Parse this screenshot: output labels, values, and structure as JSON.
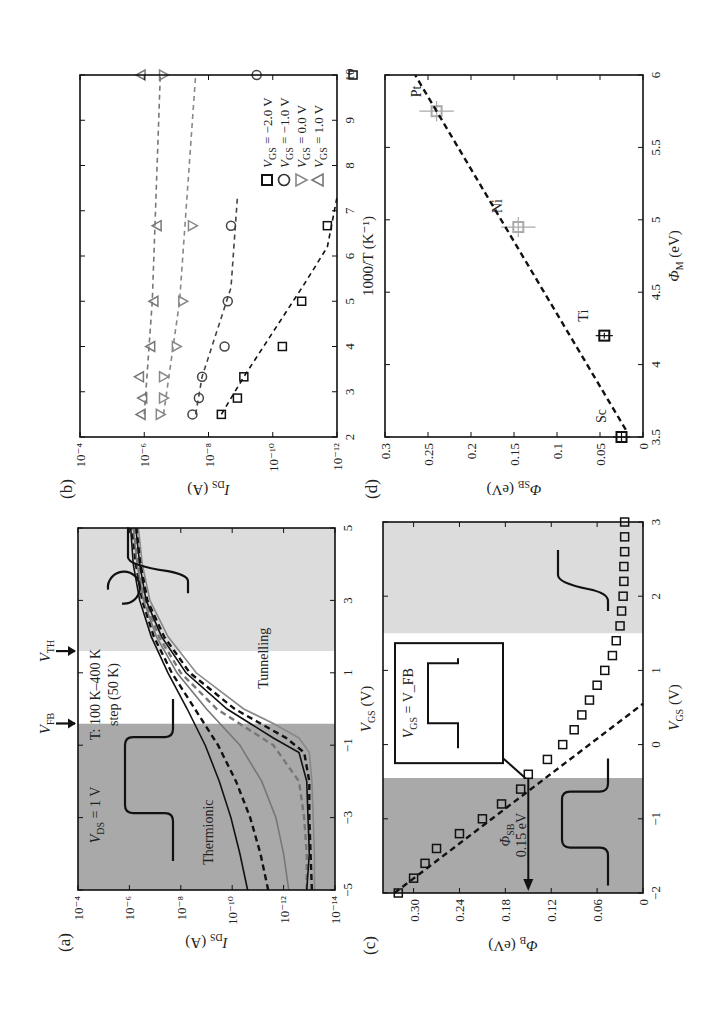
{
  "figure": {
    "panels": [
      "(a)",
      "(b)",
      "(c)",
      "(d)"
    ],
    "orientation": "rotated 90 degrees counter-clockwise on page"
  },
  "chart_data": [
    {
      "id": "a",
      "panel_label": "(a)",
      "type": "line",
      "title": "",
      "xlabel": "V_GS (V)",
      "ylabel": "I_DS (A)",
      "xlim": [
        -5,
        5
      ],
      "xticks": [
        -5,
        -3,
        -1,
        1,
        3,
        5
      ],
      "yscale": "log",
      "ylim_exp": [
        -14,
        -4
      ],
      "yticks_exp": [
        -14,
        -12,
        -10,
        -8,
        -6,
        -4
      ],
      "regions": [
        {
          "from": -5,
          "to": -0.4,
          "fill": "#a9a9a9",
          "name": "Thermionic"
        },
        {
          "from": -0.4,
          "to": 1.6,
          "fill": "#ffffff",
          "name": "flat-band to threshold"
        },
        {
          "from": 1.6,
          "to": 5,
          "fill": "#dcdcdc",
          "name": "Tunnelling"
        }
      ],
      "markers_top": [
        {
          "label": "V_FB",
          "x": -0.4
        },
        {
          "label": "V_TH",
          "x": 1.6
        }
      ],
      "annotations": [
        "V_DS = 1 V",
        "T: 100 K–400 K",
        "step (50 K)",
        "Thermionic",
        "Tunnelling"
      ],
      "series": [
        {
          "name": "400 K",
          "style": "solid",
          "color": "#111",
          "x": [
            -5,
            -4,
            -3,
            -2,
            -1,
            0,
            1,
            2,
            3,
            4,
            5
          ],
          "y_exp": [
            -10.6,
            -10.3,
            -9.95,
            -9.5,
            -8.95,
            -8.25,
            -7.5,
            -6.85,
            -6.4,
            -6.15,
            -6.05
          ]
        },
        {
          "name": "350 K",
          "style": "dashed",
          "color": "#111",
          "x": [
            -5,
            -4,
            -3,
            -2,
            -1,
            0,
            1,
            2,
            3,
            4,
            5
          ],
          "y_exp": [
            -11.4,
            -11.1,
            -10.7,
            -10.15,
            -9.45,
            -8.55,
            -7.65,
            -6.95,
            -6.5,
            -6.25,
            -6.1
          ]
        },
        {
          "name": "300 K",
          "style": "solid",
          "color": "#777",
          "x": [
            -5,
            -4,
            -3,
            -2,
            -1,
            0,
            1,
            2,
            3,
            4,
            5
          ],
          "y_exp": [
            -12.2,
            -12.0,
            -11.7,
            -11.15,
            -10.3,
            -9.0,
            -7.85,
            -7.05,
            -6.55,
            -6.3,
            -6.15
          ]
        },
        {
          "name": "250 K",
          "style": "dashed",
          "color": "#777",
          "x": [
            -5,
            -4,
            -3,
            -2,
            -1,
            -0.5,
            0,
            1,
            2,
            3,
            4,
            5
          ],
          "y_exp": [
            -12.9,
            -12.9,
            -12.8,
            -12.6,
            -11.6,
            -10.5,
            -9.4,
            -8.0,
            -7.15,
            -6.6,
            -6.35,
            -6.2
          ]
        },
        {
          "name": "200 K",
          "style": "solid",
          "color": "#111",
          "x": [
            -5,
            -4,
            -3,
            -2,
            -1.2,
            -0.8,
            -0.4,
            0,
            1,
            2,
            3,
            4,
            5
          ],
          "y_exp": [
            -12.9,
            -13.0,
            -12.95,
            -12.9,
            -12.6,
            -11.6,
            -10.7,
            -9.8,
            -8.2,
            -7.25,
            -6.65,
            -6.4,
            -6.25
          ]
        },
        {
          "name": "150 K",
          "style": "dashed",
          "color": "#111",
          "x": [
            -5,
            -4,
            -3,
            -2,
            -1.2,
            -0.8,
            -0.4,
            0,
            1,
            2,
            3,
            4,
            5
          ],
          "y_exp": [
            -13.1,
            -13.05,
            -13.0,
            -13.0,
            -12.8,
            -12.1,
            -11.1,
            -10.1,
            -8.35,
            -7.35,
            -6.7,
            -6.45,
            -6.3
          ]
        },
        {
          "name": "100 K",
          "style": "solid",
          "color": "#888",
          "x": [
            -5,
            -4,
            -3,
            -2,
            -1.2,
            -0.8,
            -0.4,
            0,
            1,
            2,
            3,
            4,
            5
          ],
          "y_exp": [
            -13.2,
            -13.2,
            -13.15,
            -13.1,
            -13.0,
            -12.6,
            -11.6,
            -10.45,
            -8.6,
            -7.5,
            -6.8,
            -6.5,
            -6.35
          ]
        }
      ]
    },
    {
      "id": "b",
      "panel_label": "(b)",
      "type": "scatter",
      "xlabel": "1000/T (K⁻¹)",
      "ylabel": "I_DS (A)",
      "xlim": [
        2,
        10
      ],
      "xticks": [
        2,
        3,
        4,
        5,
        6,
        7,
        8,
        9,
        10
      ],
      "yscale": "log",
      "ylim_exp": [
        -12,
        -4
      ],
      "yticks_exp": [
        -12,
        -10,
        -8,
        -6,
        -4
      ],
      "legend": [
        {
          "marker": "square",
          "label": "V_GS = −2.0 V"
        },
        {
          "marker": "circle",
          "label": "V_GS = −1.0 V"
        },
        {
          "marker": "triangle-down",
          "label": "V_GS = 0.0 V"
        },
        {
          "marker": "triangle-up",
          "label": "V_GS = 1.0 V"
        }
      ],
      "legend_position": "lower right",
      "series": [
        {
          "name": "V_GS = -2.0 V",
          "marker": "square",
          "color": "#111",
          "x": [
            2.5,
            2.86,
            3.33,
            4.0,
            5.0,
            6.67,
            10.0
          ],
          "y_exp": [
            -8.4,
            -8.9,
            -9.1,
            -10.3,
            -10.9,
            -11.7,
            -12.5
          ],
          "fit_x": [
            2.5,
            3.33,
            5.4,
            6.2,
            7.3
          ],
          "fit_y_exp": [
            -8.4,
            -9.1,
            -11.0,
            -11.7,
            -12.0
          ]
        },
        {
          "name": "V_GS = -1.0 V",
          "marker": "circle",
          "color": "#444",
          "x": [
            2.5,
            2.86,
            3.33,
            4.0,
            5.0,
            6.67,
            10.0
          ],
          "y_exp": [
            -7.5,
            -7.7,
            -7.8,
            -8.5,
            -8.6,
            -8.7,
            -9.5
          ],
          "fit_x": [
            2.5,
            3.33,
            5.3,
            7.3
          ],
          "fit_y_exp": [
            -7.6,
            -7.8,
            -8.7,
            -8.9
          ]
        },
        {
          "name": "V_GS = 0.0 V",
          "marker": "triangle-down",
          "color": "#888",
          "x": [
            2.5,
            2.86,
            3.33,
            4.0,
            5.0,
            6.67,
            10.0
          ],
          "y_exp": [
            -6.5,
            -6.6,
            -6.6,
            -7.0,
            -7.2,
            -7.5,
            -6.6
          ],
          "fit_x": [
            2.5,
            5.0,
            10.0
          ],
          "fit_y_exp": [
            -6.6,
            -7.1,
            -7.6
          ]
        },
        {
          "name": "V_GS = 1.0 V",
          "marker": "triangle-up",
          "color": "#777",
          "x": [
            2.5,
            2.86,
            3.33,
            4.0,
            5.0,
            6.67,
            10.0
          ],
          "y_exp": [
            -5.9,
            -5.95,
            -5.85,
            -6.2,
            -6.3,
            -6.4,
            -5.9
          ],
          "fit_x": [
            2.5,
            5.0,
            10.0
          ],
          "fit_y_exp": [
            -6.0,
            -6.25,
            -6.5
          ]
        }
      ]
    },
    {
      "id": "c",
      "panel_label": "(c)",
      "type": "scatter",
      "xlabel": "V_GS (V)",
      "ylabel": "Φ_B (eV)",
      "xlim": [
        -2,
        3
      ],
      "xticks": [
        -2,
        -1,
        0,
        1,
        2,
        3
      ],
      "ylim": [
        0,
        0.34
      ],
      "yticks": [
        0,
        0.06,
        0.12,
        0.18,
        0.24,
        0.3
      ],
      "ytick_labels": [
        "0",
        "0.06",
        "0.12",
        "0.18",
        "0.24",
        "0.30"
      ],
      "regions": [
        {
          "from": -2,
          "to": -0.45,
          "fill": "#a9a9a9"
        },
        {
          "from": -0.45,
          "to": 1.5,
          "fill": "#ffffff"
        },
        {
          "from": 1.5,
          "to": 3,
          "fill": "#dcdcdc"
        }
      ],
      "annotations": [
        "Φ_SB",
        "0.15 eV",
        "V_GS = V_FB"
      ],
      "series": [
        {
          "name": "Φ_B",
          "marker": "square",
          "color": "#111",
          "x": [
            -2.0,
            -1.8,
            -1.6,
            -1.4,
            -1.2,
            -1.0,
            -0.8,
            -0.6,
            -0.4,
            -0.2,
            0.0,
            0.2,
            0.4,
            0.6,
            0.8,
            1.0,
            1.2,
            1.4,
            1.6,
            1.8,
            2.0,
            2.2,
            2.4,
            2.6,
            2.8,
            3.0
          ],
          "y": [
            0.32,
            0.3,
            0.285,
            0.27,
            0.24,
            0.21,
            0.185,
            0.16,
            0.15,
            0.125,
            0.105,
            0.09,
            0.08,
            0.07,
            0.06,
            0.05,
            0.04,
            0.035,
            0.03,
            0.028,
            0.026,
            0.025,
            0.025,
            0.024,
            0.024,
            0.024
          ]
        },
        {
          "name": "linear fit",
          "style": "dashed",
          "color": "#111",
          "x": [
            -2.0,
            0.55
          ],
          "y": [
            0.325,
            0.0
          ]
        }
      ]
    },
    {
      "id": "d",
      "panel_label": "(d)",
      "type": "scatter",
      "xlabel": "Φ_M (eV)",
      "ylabel": "Φ_SB (eV)",
      "xlim": [
        3.5,
        6
      ],
      "xticks": [
        3.5,
        4,
        4.5,
        5,
        5.5,
        6
      ],
      "ylim": [
        0,
        0.3
      ],
      "yticks": [
        0,
        0.05,
        0.1,
        0.15,
        0.2,
        0.25,
        0.3
      ],
      "series": [
        {
          "name": "metals",
          "marker": "square",
          "points": [
            {
              "label": "Sc",
              "x": 3.5,
              "y": 0.025,
              "err_x": 0.03,
              "err_y": 0.01,
              "color": "#111"
            },
            {
              "label": "Ti",
              "x": 4.2,
              "y": 0.045,
              "err_x": 0.02,
              "err_y": 0.01,
              "color": "#111"
            },
            {
              "label": "Ni",
              "x": 4.95,
              "y": 0.145,
              "err_x": 0.07,
              "err_y": 0.02,
              "color": "#aaa"
            },
            {
              "label": "Pt",
              "x": 5.75,
              "y": 0.24,
              "err_x": 0.07,
              "err_y": 0.02,
              "color": "#aaa"
            }
          ]
        },
        {
          "name": "fit",
          "style": "dashed",
          "color": "#111",
          "x": [
            3.55,
            6.0
          ],
          "y": [
            0.02,
            0.265
          ]
        }
      ]
    }
  ]
}
